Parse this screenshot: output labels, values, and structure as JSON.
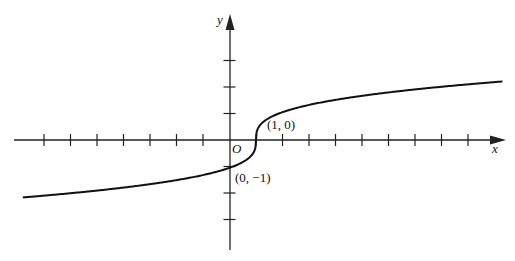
{
  "chart_data": {
    "type": "line",
    "title": "",
    "function": "y = cbrt(x - 1)",
    "xlabel": "x",
    "ylabel": "y",
    "origin_label": "O",
    "xlim": [
      -8.2,
      10.5
    ],
    "ylim": [
      -4.6,
      4.7
    ],
    "x_ticks": [
      -7,
      -6,
      -5,
      -4,
      -3,
      -2,
      -1,
      1,
      2,
      3,
      4,
      5,
      6,
      7,
      8,
      9
    ],
    "y_ticks": [
      -3,
      -2,
      -1,
      1,
      2,
      3
    ],
    "grid": false,
    "series": [
      {
        "name": "curve",
        "x": [
          -8,
          -6,
          -4,
          -2,
          -1,
          0,
          0.5,
          0.9,
          1,
          1.1,
          1.5,
          2,
          4,
          6,
          8,
          10
        ],
        "values": [
          -2.08,
          -1.91,
          -1.71,
          -1.44,
          -1.26,
          -1.0,
          -0.79,
          -0.46,
          0,
          0.46,
          0.79,
          1.0,
          1.44,
          1.71,
          1.91,
          2.08
        ]
      }
    ],
    "annotations": [
      {
        "text": "(1, 0)",
        "x": 1,
        "y": 0
      },
      {
        "text": "(0, −1)",
        "x": 0,
        "y": -1
      }
    ]
  },
  "labels": {
    "x_axis": "x",
    "y_axis": "y",
    "origin": "O",
    "point_a": "(1, 0)",
    "point_b": "(0, −1)"
  }
}
